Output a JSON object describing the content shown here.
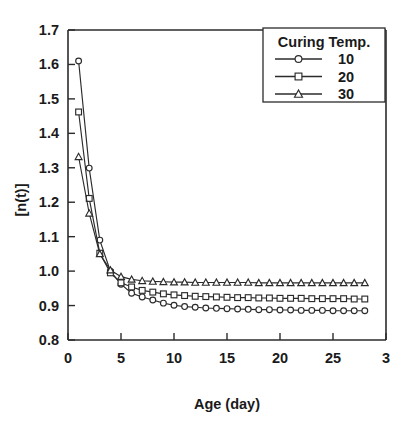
{
  "chart_data": {
    "type": "line",
    "title": "",
    "xlabel": "Age (day)",
    "ylabel": "[n(t)]",
    "xlim": [
      0,
      30
    ],
    "ylim": [
      0.8,
      1.7
    ],
    "xticks": [
      0,
      5,
      10,
      15,
      20,
      25,
      30
    ],
    "xtick_labels": [
      "0",
      "5",
      "10",
      "15",
      "20",
      "25",
      "3"
    ],
    "yticks": [
      0.8,
      0.9,
      1.0,
      1.1,
      1.2,
      1.3,
      1.4,
      1.5,
      1.6,
      1.7
    ],
    "ytick_labels": [
      "0.8",
      "0.9",
      "1.0",
      "1.1",
      "1.2",
      "1.3",
      "1.4",
      "1.5",
      "1.6",
      "1.7"
    ],
    "grid": false,
    "legend_position": "top-right",
    "legend_title": "Curing Temp.",
    "x": [
      1,
      2,
      3,
      4,
      5,
      6,
      7,
      8,
      9,
      10,
      11,
      12,
      13,
      14,
      15,
      16,
      17,
      18,
      19,
      20,
      21,
      22,
      23,
      24,
      25,
      26,
      27,
      28
    ],
    "series": [
      {
        "name": "10",
        "marker": "circle",
        "color": "#2b2b2b",
        "values": [
          1.61,
          1.299,
          1.09,
          1.0,
          0.962,
          0.936,
          0.925,
          0.916,
          0.907,
          0.901,
          0.897,
          0.895,
          0.893,
          0.892,
          0.891,
          0.89,
          0.889,
          0.888,
          0.888,
          0.887,
          0.887,
          0.886,
          0.886,
          0.886,
          0.885,
          0.885,
          0.885,
          0.885
        ]
      },
      {
        "name": "20",
        "marker": "square",
        "color": "#2b2b2b",
        "values": [
          1.462,
          1.211,
          1.052,
          0.995,
          0.966,
          0.954,
          0.944,
          0.939,
          0.934,
          0.931,
          0.929,
          0.927,
          0.926,
          0.925,
          0.924,
          0.923,
          0.923,
          0.922,
          0.922,
          0.921,
          0.921,
          0.921,
          0.92,
          0.92,
          0.92,
          0.92,
          0.919,
          0.919
        ]
      },
      {
        "name": "30",
        "marker": "triangle",
        "color": "#2b2b2b",
        "values": [
          1.332,
          1.168,
          1.05,
          1.003,
          0.984,
          0.976,
          0.972,
          0.97,
          0.969,
          0.968,
          0.968,
          0.967,
          0.967,
          0.967,
          0.967,
          0.967,
          0.967,
          0.966,
          0.966,
          0.966,
          0.966,
          0.966,
          0.966,
          0.966,
          0.966,
          0.966,
          0.966,
          0.966
        ]
      }
    ]
  },
  "legend": {
    "title": "Curing Temp.",
    "entries": [
      {
        "label": "10",
        "marker": "circle-marker-icon"
      },
      {
        "label": "20",
        "marker": "square-marker-icon"
      },
      {
        "label": "30",
        "marker": "triangle-marker-icon"
      }
    ]
  },
  "axes": {
    "x_title": "Age (day)",
    "y_title": "[n(t)]"
  }
}
